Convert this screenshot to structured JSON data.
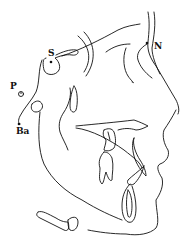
{
  "diagram": {
    "type": "cephalometric-tracing",
    "colors": {
      "line": "#111111",
      "background": "#ffffff"
    },
    "landmarks": [
      {
        "id": "S",
        "label": "S",
        "x": 51,
        "y": 62
      },
      {
        "id": "N",
        "label": "N",
        "x": 147,
        "y": 43
      },
      {
        "id": "P",
        "label": "P",
        "x": 21,
        "y": 92
      },
      {
        "id": "Ba",
        "label": "Ba",
        "x": 19,
        "y": 124
      }
    ]
  }
}
